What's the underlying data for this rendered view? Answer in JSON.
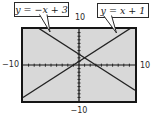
{
  "figure": {
    "callouts": [
      {
        "label": "y = −x + 3"
      },
      {
        "label": "y = x + 1"
      }
    ],
    "axis_labels": {
      "top": "10",
      "bottom": "−10",
      "left": "−10",
      "right": "10"
    }
  },
  "chart_data": {
    "type": "line",
    "title": "",
    "xlabel": "",
    "ylabel": "",
    "xlim": [
      -10,
      10
    ],
    "ylim": [
      -10,
      10
    ],
    "tick_spacing": 1,
    "grid": false,
    "legend": "callout boxes above plot",
    "series": [
      {
        "name": "y = −x + 3",
        "slope": -1,
        "intercept": 3,
        "x": [
          -10,
          10
        ],
        "y": [
          13,
          -7
        ]
      },
      {
        "name": "y = x + 1",
        "slope": 1,
        "intercept": 1,
        "x": [
          -10,
          10
        ],
        "y": [
          -9,
          11
        ]
      }
    ],
    "intersection": [
      1,
      2
    ],
    "colors": {
      "screen_bg": "#d8d8d8",
      "screen_border": "#161616",
      "axis": "#111111",
      "line": "#222222"
    }
  }
}
